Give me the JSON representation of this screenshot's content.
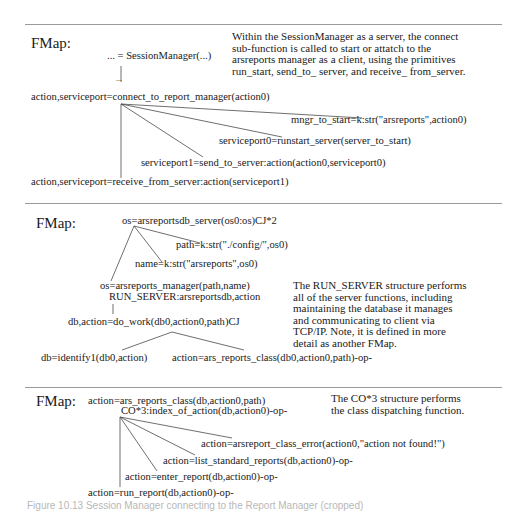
{
  "panels": [
    {
      "label": "FMap:",
      "note": [
        "Within the SessionManager as a server, the connect",
        "sub-function is called to start or attatch to the",
        "arsreports manager as a client, using the primitives",
        "run_start,  send_to_ server, and receive_ from_server."
      ],
      "nodes": {
        "root": "... = SessionManager(...)",
        "ellipsis": "...",
        "connect": "action,serviceport=connect_to_report_manager(action0)",
        "mngr": "mngr_to_start=k:str(\"arsreports\",action0)",
        "runstart": "serviceport0=runstart_server(server_to_start)",
        "send": "serviceport1=send_to_server:action(action0,serviceport0)",
        "receive": "action,serviceport=receive_from_server:action(serviceport1)"
      }
    },
    {
      "label": "FMap:",
      "note": [
        "The RUN_SERVER structure performs",
        "all of the server functions, including",
        "maintaining the database it manages",
        "and communicating to client via",
        "TCP/IP.  Note, it is defined in more",
        "detail as another FMap."
      ],
      "nodes": {
        "root": "os=arsreportsdb_server(os0:os)CJ*2",
        "path": "path=k:str(\"./config/\",os0)",
        "name": "name=k:str(\"arsreports\",os0)",
        "manager": "os=arsreports_manager(path,name)",
        "run_server": "RUN_SERVER:arsreportsdb,action",
        "do_work": "db,action=do_work(db0,action0,path)CJ",
        "identify": "db=identify1(db0,action)",
        "class": "action=ars_reports_class(db0,action0,path)-op-"
      }
    },
    {
      "label": "FMap:",
      "note": [
        "The CO*3 structure performs",
        "the class dispatching function."
      ],
      "nodes": {
        "root": "action=ars_reports_class(db,action0,path)",
        "index": "CO*3:index_of_action(db,action0)-op-",
        "error": "action=arsreport_class_error(action0,\"action not found!\")",
        "list": "action=list_standard_reports(db,action0)-op-",
        "enter": "action=enter_report(db,action0)-op-",
        "run": "action=run_report(db,action0)-op-"
      }
    }
  ],
  "caption": "Figure 10.13  Session Manager connecting to the Report Manager (cropped)",
  "colors": {
    "text": "#1a1a1a",
    "rule": "#9a9a9a",
    "connector": "#4a4a4a",
    "caption": "#b8b8b8"
  }
}
